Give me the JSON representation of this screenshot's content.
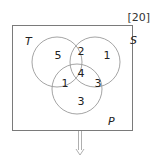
{
  "diagram": {
    "type": "venn",
    "total_label": "[20]",
    "colors": {
      "stroke": "#9a9a9a",
      "border": "#7a7a7a",
      "text": "#222222"
    },
    "sets": {
      "T": {
        "label": "T"
      },
      "S": {
        "label": "S"
      },
      "P": {
        "label": "P"
      }
    },
    "regions": {
      "T_only": "5",
      "T_and_S_only": "2",
      "S_only": "1",
      "T_S_P": "4",
      "T_and_P_only": "1",
      "S_and_P_only": "3",
      "P_only": "3"
    },
    "arrow": {
      "direction": "down",
      "icon": "down-arrow-icon"
    }
  }
}
